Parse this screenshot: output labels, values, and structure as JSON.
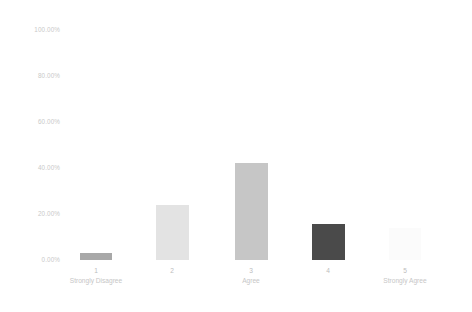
{
  "chart_data": {
    "type": "bar",
    "title": "",
    "subtitle": "",
    "xlabel": "",
    "ylabel": "",
    "ylim": [
      0,
      100
    ],
    "ytick_labels": [
      "100.00%",
      "80.00%",
      "60.00%",
      "40.00%",
      "20.00%",
      "0.00%"
    ],
    "ytick_values": [
      100,
      80,
      60,
      40,
      20,
      0
    ],
    "grid": false,
    "legend": false,
    "categories": [
      "1",
      "2",
      "3",
      "4",
      "5"
    ],
    "category_captions": [
      "Strongly Disagree",
      "",
      "Agree",
      "",
      "Strongly Agree"
    ],
    "values": [
      3.0,
      24.0,
      42.0,
      15.6,
      14.0
    ],
    "value_labels": [
      "3.00%",
      "24.00%",
      "42.00%",
      "15.60%",
      "14.00%"
    ],
    "bar_colors": [
      "#a8a8a8",
      "#e3e3e3",
      "#c6c6c6",
      "#4a4a4a",
      "#fbfbfb"
    ]
  },
  "axes": {
    "y_ticks": [
      {
        "label": "100.00%",
        "value": 100
      },
      {
        "label": "80.00%",
        "value": 80
      },
      {
        "label": "60.00%",
        "value": 60
      },
      {
        "label": "40.00%",
        "value": 40
      },
      {
        "label": "20.00%",
        "value": 20
      },
      {
        "label": "0.00%",
        "value": 0
      }
    ],
    "x_ticks": [
      {
        "num": "1",
        "caption": "Strongly Disagree"
      },
      {
        "num": "2",
        "caption": ""
      },
      {
        "num": "3",
        "caption": "Agree"
      },
      {
        "num": "4",
        "caption": ""
      },
      {
        "num": "5",
        "caption": "Strongly Agree"
      }
    ]
  }
}
